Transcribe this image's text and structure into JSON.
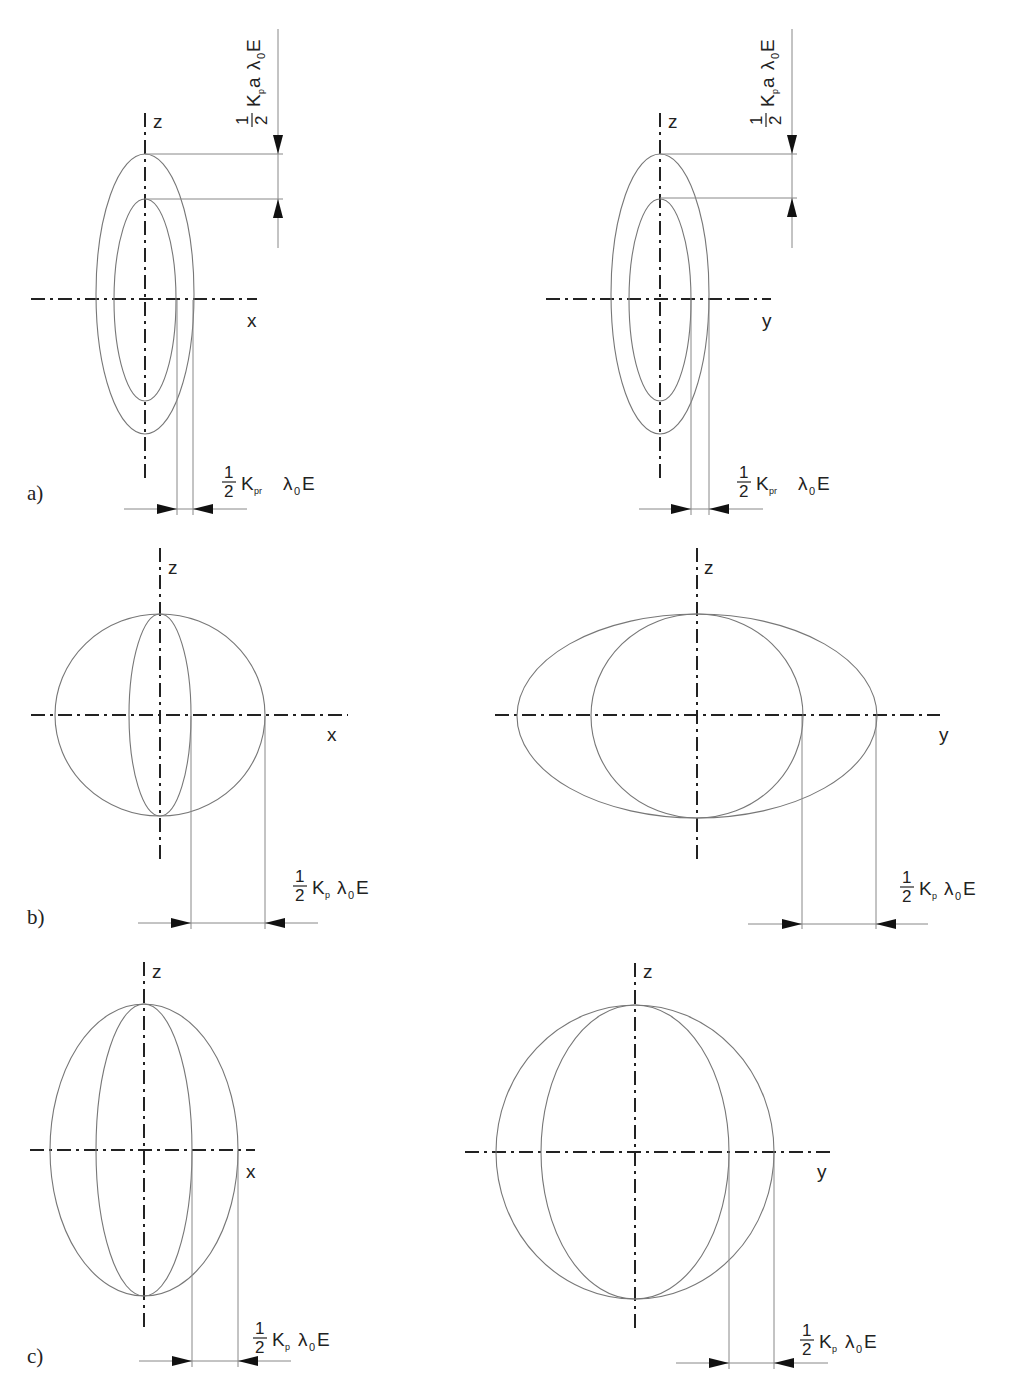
{
  "figure": {
    "panels": [
      {
        "id": "a",
        "label": "a)",
        "views": [
          {
            "side": "left",
            "axes": {
              "vertical": "z",
              "horizontal": "x"
            },
            "outer_ellipse": {
              "cx": 145,
              "cy": 299,
              "rx": 49,
              "ry": 142
            },
            "inner_ellipse": {
              "cx": 145,
              "cy": 299,
              "rx": 31,
              "ry": 101
            },
            "vertical_dimension": {
              "frac_num": "1",
              "frac_den": "2",
              "symbol": "K",
              "subscript": "p",
              "factor": "a",
              "lambda": "λ",
              "lambda_sub": "0",
              "field": "E"
            },
            "horizontal_dimension": {
              "frac_num": "1",
              "frac_den": "2",
              "symbol": "K",
              "subscript": "pr",
              "lambda": "λ",
              "lambda_sub": "0",
              "field": "E"
            }
          },
          {
            "side": "right",
            "axes": {
              "vertical": "z",
              "horizontal": "y"
            },
            "outer_ellipse": {
              "cx": 660,
              "cy": 299,
              "rx": 49,
              "ry": 142
            },
            "inner_ellipse": {
              "cx": 660,
              "cy": 299,
              "rx": 31,
              "ry": 101
            },
            "vertical_dimension": {
              "frac_num": "1",
              "frac_den": "2",
              "symbol": "K",
              "subscript": "p",
              "factor": "a",
              "lambda": "λ",
              "lambda_sub": "0",
              "field": "E"
            },
            "horizontal_dimension": {
              "frac_num": "1",
              "frac_den": "2",
              "symbol": "K",
              "subscript": "pr",
              "lambda": "λ",
              "lambda_sub": "0",
              "field": "E"
            }
          }
        ]
      },
      {
        "id": "b",
        "label": "b)",
        "views": [
          {
            "side": "left",
            "axes": {
              "vertical": "z",
              "horizontal": "x"
            },
            "outer_ellipse": {
              "cx": 160,
              "cy": 715,
              "rx": 105,
              "ry": 101
            },
            "inner_ellipse": {
              "cx": 160,
              "cy": 715,
              "rx": 31,
              "ry": 101
            },
            "horizontal_dimension": {
              "frac_num": "1",
              "frac_den": "2",
              "symbol": "K",
              "subscript": "p",
              "lambda": "λ",
              "lambda_sub": "0",
              "field": "E"
            }
          },
          {
            "side": "right",
            "axes": {
              "vertical": "z",
              "horizontal": "y"
            },
            "outer_ellipse": {
              "cx": 697,
              "cy": 716,
              "rx": 180,
              "ry": 102
            },
            "inner_ellipse": {
              "cx": 697,
              "cy": 716,
              "rx": 106,
              "ry": 102
            },
            "horizontal_dimension": {
              "frac_num": "1",
              "frac_den": "2",
              "symbol": "K",
              "subscript": "p",
              "lambda": "λ",
              "lambda_sub": "0",
              "field": "E"
            }
          }
        ]
      },
      {
        "id": "c",
        "label": "c)",
        "views": [
          {
            "side": "left",
            "axes": {
              "vertical": "z",
              "horizontal": "x"
            },
            "outer_ellipse": {
              "cx": 144,
              "cy": 1150,
              "rx": 94,
              "ry": 146
            },
            "inner_ellipse": {
              "cx": 144,
              "cy": 1150,
              "rx": 48,
              "ry": 146
            },
            "horizontal_dimension": {
              "frac_num": "1",
              "frac_den": "2",
              "symbol": "K",
              "subscript": "p",
              "lambda": "λ",
              "lambda_sub": "0",
              "field": "E"
            }
          },
          {
            "side": "right",
            "axes": {
              "vertical": "z",
              "horizontal": "y"
            },
            "outer_ellipse": {
              "cx": 635,
              "cy": 1152,
              "rx": 139,
              "ry": 147
            },
            "inner_ellipse": {
              "cx": 635,
              "cy": 1152,
              "rx": 94,
              "ry": 147
            },
            "horizontal_dimension": {
              "frac_num": "1",
              "frac_den": "2",
              "symbol": "K",
              "subscript": "p",
              "lambda": "λ",
              "lambda_sub": "0",
              "field": "E"
            }
          }
        ]
      }
    ]
  }
}
